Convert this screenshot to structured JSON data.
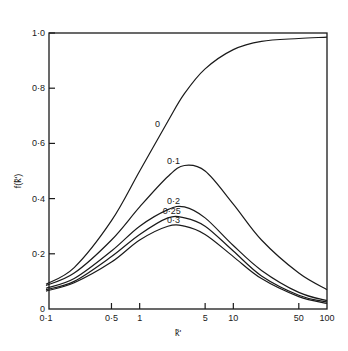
{
  "chart_data": {
    "type": "line",
    "title": "",
    "xlabel": "k̃'",
    "ylabel": "f(k̃')",
    "xscale": "log",
    "xlim": [
      0.1,
      100
    ],
    "ylim": [
      0,
      1.0
    ],
    "grid": false,
    "legend": "inline labels on curves",
    "x_ticks": [
      0.1,
      0.5,
      1,
      5,
      10,
      50,
      100
    ],
    "x_tick_labels": [
      "0·1",
      "0·5",
      "1",
      "5",
      "10",
      "50",
      "100"
    ],
    "y_ticks": [
      0,
      0.2,
      0.4,
      0.6,
      0.8,
      1.0
    ],
    "y_tick_labels": [
      "0",
      "0·2",
      "0·4",
      "0·6",
      "0·8",
      "1·0"
    ],
    "x": [
      0.1,
      0.2,
      0.5,
      1,
      2,
      3,
      5,
      10,
      20,
      50,
      100
    ],
    "series": [
      {
        "name": "0",
        "label": "0",
        "label_at": [
          1.55,
          0.66
        ],
        "values": [
          0.09,
          0.15,
          0.32,
          0.5,
          0.68,
          0.78,
          0.87,
          0.94,
          0.97,
          0.98,
          0.985
        ]
      },
      {
        "name": "0.1",
        "label": "0·1",
        "label_at": [
          2.3,
          0.525
        ],
        "values": [
          0.085,
          0.13,
          0.25,
          0.37,
          0.48,
          0.52,
          0.5,
          0.38,
          0.25,
          0.13,
          0.07
        ]
      },
      {
        "name": "0.2",
        "label": "0·2",
        "label_at": [
          2.3,
          0.38
        ],
        "values": [
          0.075,
          0.11,
          0.21,
          0.3,
          0.36,
          0.37,
          0.33,
          0.23,
          0.14,
          0.06,
          0.03
        ]
      },
      {
        "name": "0.25",
        "label": "0·25",
        "label_at": [
          2.2,
          0.345
        ],
        "values": [
          0.07,
          0.1,
          0.19,
          0.27,
          0.33,
          0.33,
          0.3,
          0.21,
          0.12,
          0.05,
          0.025
        ]
      },
      {
        "name": "0.3",
        "label": "0·3",
        "label_at": [
          2.3,
          0.31
        ],
        "values": [
          0.065,
          0.095,
          0.17,
          0.25,
          0.3,
          0.3,
          0.27,
          0.19,
          0.11,
          0.045,
          0.02
        ]
      }
    ]
  },
  "layout": {
    "plot_left": 46,
    "plot_right": 327,
    "plot_top": 33,
    "plot_bottom": 309,
    "line_color": "#1a1a1a"
  }
}
